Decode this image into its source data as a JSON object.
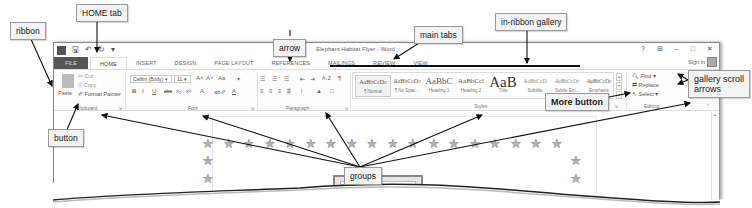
{
  "window": {
    "title": "Elephant Habitat Flyer - Word",
    "quick_access": [
      "word-icon",
      "save-icon",
      "undo-icon",
      "redo-icon",
      "customize-icon"
    ],
    "controls": [
      "?",
      "⊞",
      "–",
      "□",
      "✕"
    ],
    "sign_in": "Sign in"
  },
  "tabs": [
    {
      "label": "FILE"
    },
    {
      "label": "HOME",
      "active": true
    },
    {
      "label": "INSERT"
    },
    {
      "label": "DESIGN"
    },
    {
      "label": "PAGE LAYOUT"
    },
    {
      "label": "REFERENCES"
    },
    {
      "label": "MAILINGS"
    },
    {
      "label": "REVIEW"
    },
    {
      "label": "VIEW"
    }
  ],
  "ribbon": {
    "clipboard": {
      "label": "Clipboard",
      "paste": "Paste",
      "cut": "Cut",
      "copy": "Copy",
      "format_painter": "Format Painter"
    },
    "font": {
      "label": "Font",
      "font_name": "Calibri (Body)",
      "font_size": "11",
      "grow": "A˄",
      "shrink": "A˅",
      "change_case": "Aa",
      "clear": "✦",
      "bold": "B",
      "italic": "I",
      "underline": "U",
      "strike": "abc",
      "subscript": "x₂",
      "superscript": "x²",
      "effects": "A",
      "highlight": "ab✐",
      "color": "A"
    },
    "paragraph": {
      "label": "Paragraph",
      "bullets": "☰",
      "numbering": "☰",
      "multilevel": "☰",
      "decrease_indent": "⇤",
      "increase_indent": "⇥",
      "sort": "A↓Z",
      "show_marks": "¶",
      "align": [
        "≡",
        "≡",
        "≡",
        "≡"
      ],
      "line_spacing": "↕",
      "shading": "▲",
      "borders": "□"
    },
    "styles": {
      "label": "Styles",
      "items": [
        {
          "sample": "AaBbCcDc",
          "name": "¶ Normal",
          "selected": true,
          "size": 6
        },
        {
          "sample": "AaBbCcDc",
          "name": "¶ No Spac...",
          "size": 6
        },
        {
          "sample": "AaBbC",
          "name": "Heading 1",
          "size": 9
        },
        {
          "sample": "AaBbCcl",
          "name": "Heading 2",
          "size": 7
        },
        {
          "sample": "AaB",
          "name": "Title",
          "size": 15
        },
        {
          "sample": "AaBbCcD",
          "name": "Subtitle",
          "size": 5.5
        },
        {
          "sample": "AaBbCcDc",
          "name": "Subtle Em...",
          "size": 5.5
        },
        {
          "sample": "AaBbCcDc",
          "name": "Emphasis",
          "size": 5.5
        }
      ],
      "scroll_up": "▴",
      "scroll_down": "▾",
      "more": "▾"
    },
    "editing": {
      "label": "Editing",
      "find": "Find",
      "replace": "Replace",
      "select": "Select"
    }
  },
  "callouts": {
    "ribbon": "ribbon",
    "home_tab": "HOME tab",
    "arrow": "arrow",
    "main_tabs": "main tabs",
    "in_ribbon_gallery": "in-ribbon gallery",
    "gallery_scroll_arrows": "gallery scroll\narrows",
    "more_button": "More button",
    "button": "button",
    "groups": "groups"
  },
  "document": {
    "star_glyph": "★",
    "top_row_star_count": 18
  }
}
